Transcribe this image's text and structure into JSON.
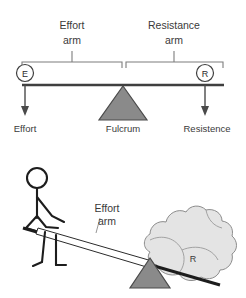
{
  "figure": {
    "colors": {
      "background": "#ffffff",
      "fulcrum_fill": "#8a8a8a",
      "fulcrum_stroke": "#4a4a4a",
      "beam_stroke": "#3f3f3f",
      "bracket_stroke": "#7d7d7d",
      "text": "#3a3a3a",
      "rock_fill": "#e2e2e2",
      "rock_stroke": "#8d8d8d",
      "stick_figure": "#1d1d1d"
    }
  },
  "schematic": {
    "effort_arm_label_line1": "Effort",
    "effort_arm_label_line2": "arm",
    "resistance_arm_label_line1": "Resistance",
    "resistance_arm_label_line2": "arm",
    "node_effort": "E",
    "node_resistance": "R",
    "label_effort": "Effort",
    "label_fulcrum": "Fulcrum",
    "label_resistance": "Resistence"
  },
  "illustration": {
    "effort_arm_label_line1": "Effort",
    "effort_arm_label_line2": "arm",
    "rock_label": "R"
  }
}
